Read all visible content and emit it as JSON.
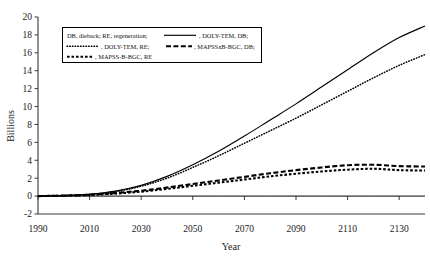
{
  "chart_data": {
    "type": "line",
    "title": "",
    "xlabel": "Year",
    "ylabel": "Billions",
    "xlim": [
      1990,
      2140
    ],
    "ylim": [
      -2,
      20
    ],
    "xticks": [
      1990,
      2010,
      2030,
      2050,
      2070,
      2090,
      2110,
      2130
    ],
    "yticks": [
      -2,
      0,
      2,
      4,
      6,
      8,
      10,
      12,
      14,
      16,
      18,
      20
    ],
    "grid": false,
    "legend_position": "upper-left",
    "legend_note": "DB, dieback; RE, regeneration;",
    "x": [
      1990,
      2000,
      2010,
      2020,
      2030,
      2040,
      2050,
      2060,
      2070,
      2080,
      2090,
      2100,
      2110,
      2120,
      2130,
      2140
    ],
    "series": [
      {
        "name": "DOLY-TEM, DB",
        "style": "solid",
        "values": [
          0.0,
          0.05,
          0.2,
          0.55,
          1.2,
          2.2,
          3.5,
          5.0,
          6.7,
          8.5,
          10.3,
          12.2,
          14.1,
          16.0,
          17.7,
          19.0
        ]
      },
      {
        "name": "DOLY-TEM, RE",
        "style": "dotted",
        "values": [
          0.0,
          0.05,
          0.2,
          0.5,
          1.1,
          2.0,
          3.2,
          4.5,
          5.9,
          7.3,
          8.7,
          10.2,
          11.7,
          13.2,
          14.6,
          15.8
        ]
      },
      {
        "name": "MAPSSxB-BGC, DB",
        "style": "long-dash",
        "values": [
          0.0,
          0.05,
          0.15,
          0.35,
          0.6,
          0.95,
          1.35,
          1.75,
          2.15,
          2.55,
          2.9,
          3.2,
          3.45,
          3.5,
          3.35,
          3.3
        ]
      },
      {
        "name": "MAPSS-B-BGC, RE",
        "style": "short-dash",
        "values": [
          0.0,
          0.05,
          0.12,
          0.28,
          0.5,
          0.8,
          1.15,
          1.5,
          1.85,
          2.2,
          2.5,
          2.75,
          2.95,
          3.05,
          2.9,
          2.85
        ]
      },
      {
        "name": "baseline",
        "style": "solid-thin",
        "values": [
          0.0,
          0.0,
          0.0,
          0.0,
          0.0,
          0.0,
          0.0,
          0.0,
          0.0,
          0.0,
          0.0,
          0.0,
          0.0,
          0.0,
          0.0,
          0.0
        ]
      }
    ]
  },
  "axes": {
    "y_title": "Billions",
    "x_title": "Year",
    "y_tick_labels": [
      "20",
      "18",
      "16",
      "14",
      "12",
      "10",
      "8",
      "6",
      "4",
      "2",
      "0",
      "-2"
    ],
    "x_tick_labels": [
      "1990",
      "2010",
      "2030",
      "2050",
      "2070",
      "2090",
      "2110",
      "2130"
    ]
  },
  "legend": {
    "note": "DB, dieback; RE, regeneration;",
    "entries": [
      {
        "label": ", DOLY-TEM, DB;",
        "style": "solid"
      },
      {
        "label": ", DOLY-TEM, RE;",
        "style": "dotted"
      },
      {
        "label": ", MAPSSxB-BGC, DB;",
        "style": "long-dash"
      },
      {
        "label": ", MAPSS-B-BGC, RE",
        "style": "short-dash"
      }
    ]
  }
}
